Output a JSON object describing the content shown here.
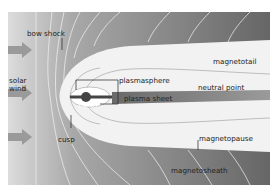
{
  "diagram": {
    "labels": {
      "bow_shock": "bow shock",
      "solar_wind": [
        "solar",
        "wind"
      ],
      "plasmasphere": "plasmasphere",
      "earth": "Earth",
      "plasma_sheet": "plasma sheet",
      "neutral_point": "neutral point",
      "magnetotail": "magnetotail",
      "cusp": "cusp",
      "magnetopause": "magnetopause",
      "magnetosheath": "magnetosheath"
    },
    "colors": {
      "background_dark": "#6e6e6e",
      "background_light": "#c8c8c8",
      "magnetosphere": "#f2f2f2",
      "plasma_sheet": "#8a8a8a",
      "field_lines": "#ffffff",
      "arrows": "#9a9a9a",
      "text": "#222222"
    }
  }
}
